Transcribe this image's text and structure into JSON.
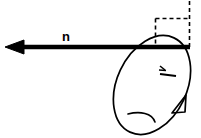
{
  "figure": {
    "background_color": "#ffffff",
    "stroke_color": "#000000",
    "width": 201,
    "height": 138
  },
  "labels": {
    "normal_vector": "n"
  },
  "elements": {
    "normal_arrow": {
      "name": "normal-vector-arrow",
      "direction": "left",
      "from_x": 190,
      "to_x": 6,
      "y": 47,
      "line_width": 4,
      "arrowhead": "solid-triangle"
    },
    "loop": {
      "name": "circulation-loop-ellipse",
      "center_x": 152,
      "center_y": 85,
      "radius_x": 35,
      "radius_y": 52,
      "rotation_deg": 25,
      "line_width": 1.5
    },
    "loop_direction_arrow": {
      "name": "loop-direction-arrowhead",
      "style": "open-v",
      "points_toward": "up-right",
      "x": 180,
      "y": 104
    },
    "right_angle_marker": {
      "name": "right-angle-dashed-marker",
      "left_x": 156,
      "right_x": 189,
      "top_y": 18,
      "bottom_y": 47,
      "dash_pattern": "4,3",
      "line_width": 1.5
    },
    "vertical_dashed_axis": {
      "name": "vertical-dashed-axis",
      "x": 189,
      "top_y": 1,
      "bottom_y": 47,
      "dash_pattern": "4,3"
    },
    "inner_tick_mark": {
      "name": "inner-direction-tick",
      "x": 163,
      "y": 71
    },
    "inner_hook": {
      "name": "inner-surface-hook-curve",
      "x": 140,
      "y": 116
    }
  }
}
